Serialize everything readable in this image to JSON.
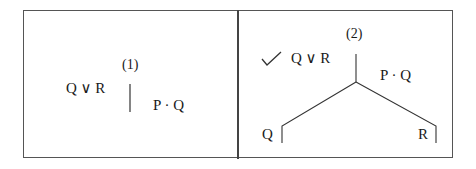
{
  "panels": [
    {
      "label": "(1)",
      "left_formula": "Q ∨ R",
      "right_formula": "P · Q"
    },
    {
      "label": "(2)",
      "check_mark": "✓",
      "checked_formula": "Q ∨ R",
      "right_formula": "P · Q",
      "branches": [
        "Q",
        "R"
      ]
    }
  ]
}
